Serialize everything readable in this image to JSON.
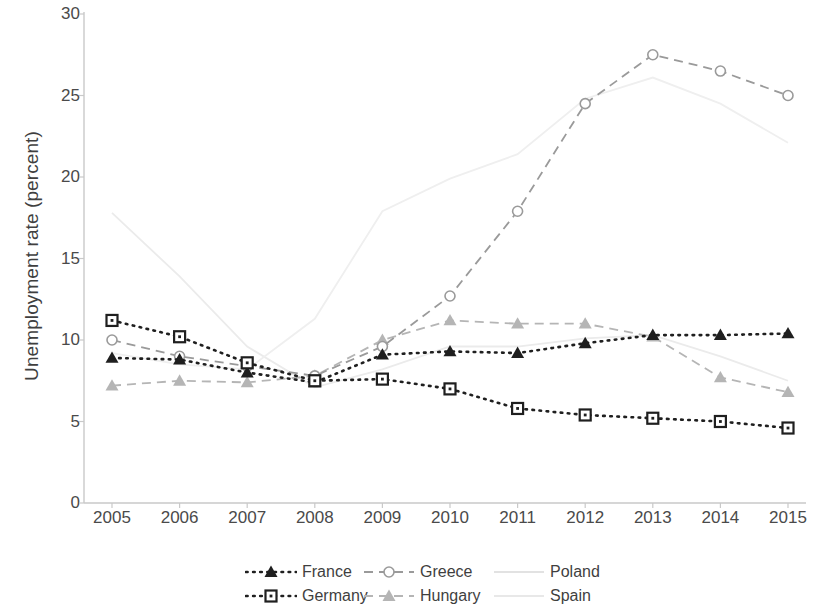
{
  "chart_data": {
    "type": "line",
    "title": "",
    "xlabel": "",
    "ylabel": "Unemployment rate (percent)",
    "categories": [
      "2005",
      "2006",
      "2007",
      "2008",
      "2009",
      "2010",
      "2011",
      "2012",
      "2013",
      "2014",
      "2015"
    ],
    "ylim": [
      0,
      30
    ],
    "yticks": [
      0,
      5,
      10,
      15,
      20,
      25,
      30
    ],
    "grid": false,
    "legend_position": "bottom",
    "series": [
      {
        "name": "France",
        "color": "#1f1f1f",
        "marker": "triangle",
        "linestyle": "dotted",
        "values": [
          8.9,
          8.8,
          8.0,
          7.4,
          9.1,
          9.3,
          9.2,
          9.8,
          10.3,
          10.3,
          10.4
        ]
      },
      {
        "name": "Germany",
        "color": "#1f1f1f",
        "marker": "square",
        "linestyle": "dotted",
        "values": [
          11.2,
          10.2,
          8.6,
          7.5,
          7.6,
          7.0,
          5.8,
          5.4,
          5.2,
          5.0,
          4.6
        ]
      },
      {
        "name": "Greece",
        "color": "#9a9a9a",
        "marker": "circle",
        "linestyle": "dashed",
        "values": [
          10.0,
          9.0,
          8.4,
          7.8,
          9.6,
          12.7,
          17.9,
          24.5,
          27.5,
          26.5,
          25.0
        ]
      },
      {
        "name": "Hungary",
        "color": "#b5b5b5",
        "marker": "triangle",
        "linestyle": "dashed",
        "values": [
          7.2,
          7.5,
          7.4,
          7.8,
          10.0,
          11.2,
          11.0,
          11.0,
          10.2,
          7.7,
          6.8
        ]
      },
      {
        "name": "Poland",
        "color": "#ebebeb",
        "marker": "none",
        "linestyle": "solid",
        "values": [
          17.8,
          13.9,
          9.6,
          7.1,
          8.2,
          9.6,
          9.6,
          10.1,
          10.3,
          9.0,
          7.5
        ]
      },
      {
        "name": "Spain",
        "color": "#efefef",
        "marker": "none",
        "linestyle": "solid",
        "values": [
          9.2,
          8.5,
          8.2,
          11.3,
          17.9,
          19.9,
          21.4,
          24.8,
          26.1,
          24.5,
          22.1
        ]
      }
    ]
  },
  "axis": {
    "y_tick_labels": [
      "0",
      "5",
      "10",
      "15",
      "20",
      "25",
      "30"
    ],
    "y_axis_title": "Unemployment rate (percent)",
    "x_tick_labels": [
      "2005",
      "2006",
      "2007",
      "2008",
      "2009",
      "2010",
      "2011",
      "2012",
      "2013",
      "2014",
      "2015"
    ]
  },
  "legend": {
    "entries": [
      {
        "label": "France",
        "marker": "triangle",
        "linestyle": "dotted",
        "color": "#1f1f1f"
      },
      {
        "label": "Greece",
        "marker": "circle",
        "linestyle": "dashed",
        "color": "#9a9a9a"
      },
      {
        "label": "Poland",
        "marker": "none",
        "linestyle": "solid",
        "color": "#e2e2e2"
      },
      {
        "label": "Germany",
        "marker": "square",
        "linestyle": "dotted",
        "color": "#1f1f1f"
      },
      {
        "label": "Hungary",
        "marker": "triangle",
        "linestyle": "dashed",
        "color": "#b5b5b5"
      },
      {
        "label": "Spain",
        "marker": "none",
        "linestyle": "solid",
        "color": "#e8e8e8"
      }
    ]
  }
}
